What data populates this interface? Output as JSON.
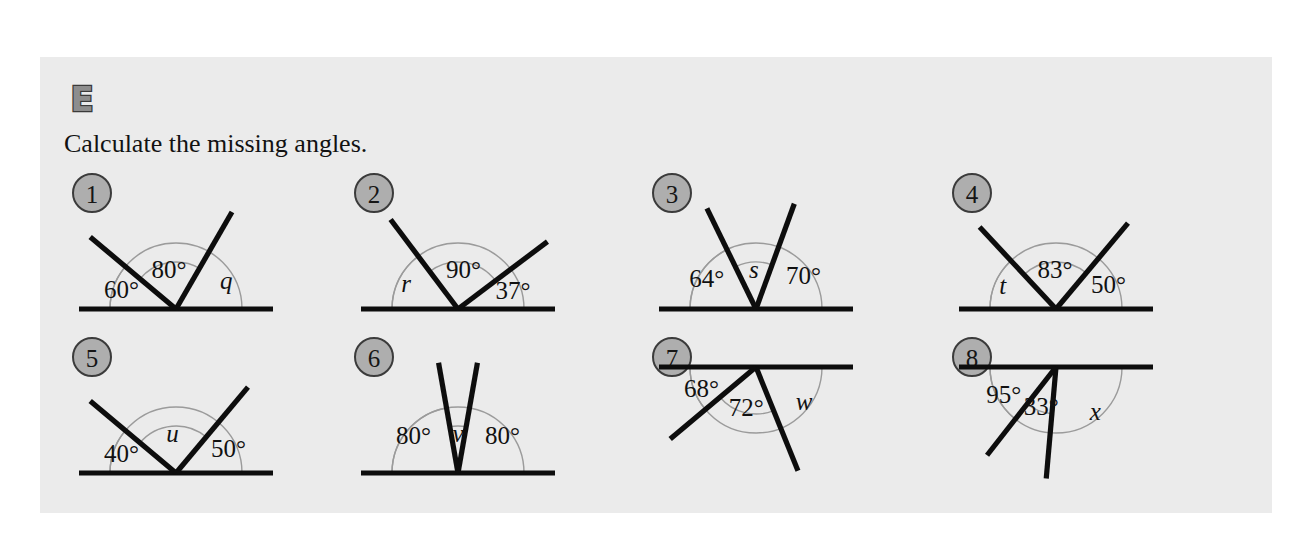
{
  "header": {
    "exercise_letter": "E",
    "instruction": "Calculate the missing angles."
  },
  "colors": {
    "panel_background": "#ebebeb",
    "page_background": "#ffffff",
    "line": "#0d0d0d",
    "arc": "#9b9b9b",
    "badge_fill": "#aeaeae",
    "badge_stroke": "#3b3b3b",
    "text": "#111111"
  },
  "problems": [
    {
      "number": "1",
      "orientation": "baseline-bottom",
      "labels": [
        {
          "text": "60°",
          "kind": "value"
        },
        {
          "text": "80°",
          "kind": "value"
        },
        {
          "text": "q",
          "kind": "variable"
        }
      ],
      "unknown": "q",
      "known_angles": [
        60,
        80
      ],
      "rays_deg": [
        60,
        140
      ]
    },
    {
      "number": "2",
      "orientation": "baseline-bottom",
      "labels": [
        {
          "text": "r",
          "kind": "variable"
        },
        {
          "text": "90°",
          "kind": "value"
        },
        {
          "text": "37°",
          "kind": "value"
        }
      ],
      "unknown": "r",
      "known_angles": [
        90,
        37
      ],
      "rays_deg": [
        37,
        127
      ]
    },
    {
      "number": "3",
      "orientation": "baseline-bottom",
      "labels": [
        {
          "text": "64°",
          "kind": "value"
        },
        {
          "text": "s",
          "kind": "variable"
        },
        {
          "text": "70°",
          "kind": "value"
        }
      ],
      "unknown": "s",
      "known_angles": [
        64,
        70
      ],
      "rays_deg": [
        70,
        116
      ]
    },
    {
      "number": "4",
      "orientation": "baseline-bottom",
      "labels": [
        {
          "text": "t",
          "kind": "variable"
        },
        {
          "text": "83°",
          "kind": "value"
        },
        {
          "text": "50°",
          "kind": "value"
        }
      ],
      "unknown": "t",
      "known_angles": [
        83,
        50
      ],
      "rays_deg": [
        50,
        133
      ]
    },
    {
      "number": "5",
      "orientation": "baseline-bottom",
      "labels": [
        {
          "text": "40°",
          "kind": "value"
        },
        {
          "text": "u",
          "kind": "variable"
        },
        {
          "text": "50°",
          "kind": "value"
        }
      ],
      "unknown": "u",
      "known_angles": [
        40,
        50
      ],
      "rays_deg": [
        50,
        140
      ]
    },
    {
      "number": "6",
      "orientation": "baseline-bottom",
      "labels": [
        {
          "text": "80°",
          "kind": "value"
        },
        {
          "text": "v",
          "kind": "variable"
        },
        {
          "text": "80°",
          "kind": "value"
        }
      ],
      "unknown": "v",
      "known_angles": [
        80,
        80
      ],
      "rays_deg": [
        80,
        100
      ]
    },
    {
      "number": "7",
      "orientation": "baseline-top",
      "labels": [
        {
          "text": "68°",
          "kind": "value"
        },
        {
          "text": "72°",
          "kind": "value"
        },
        {
          "text": "w",
          "kind": "variable"
        }
      ],
      "unknown": "w",
      "known_angles": [
        68,
        72
      ],
      "rays_deg": [
        68,
        140
      ]
    },
    {
      "number": "8",
      "orientation": "baseline-top",
      "labels": [
        {
          "text": "95°",
          "kind": "value"
        },
        {
          "text": "33°",
          "kind": "value"
        },
        {
          "text": "x",
          "kind": "variable"
        }
      ],
      "unknown": "x",
      "known_angles": [
        95,
        33
      ],
      "rays_deg": [
        95,
        128
      ]
    }
  ]
}
